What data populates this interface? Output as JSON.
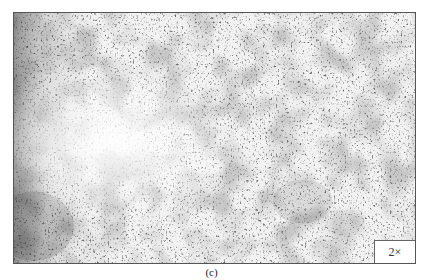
{
  "figure": {
    "panel_label": "(c)",
    "magnification_label": "2×",
    "image_description": "grayscale micrograph texture, bright diffuse region left-center, darker patches on left edge and bottom-left",
    "colors": {
      "border": "#555555",
      "background": "#ffffff",
      "texture_dark": "#3a3a3a",
      "texture_light": "#f8f8f8"
    }
  }
}
